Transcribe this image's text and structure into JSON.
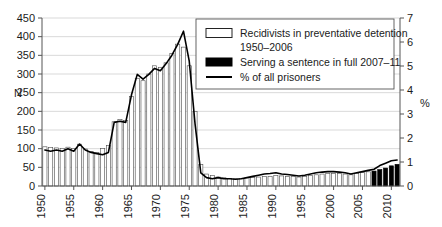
{
  "chart_data": {
    "type": "bar",
    "title": "",
    "subtitle": "",
    "xlabel": "",
    "ylabel": "N",
    "y2label": "%",
    "grid": true,
    "legend_position": "top-right",
    "ylim": [
      0,
      450
    ],
    "y2lim": [
      0,
      7
    ],
    "xlim": [
      1950,
      2011
    ],
    "yticks": [
      0,
      50,
      100,
      150,
      200,
      250,
      300,
      350,
      400,
      450
    ],
    "y2ticks": [
      0,
      1,
      2,
      3,
      4,
      5,
      6,
      7
    ],
    "xticks": [
      1950,
      1955,
      1960,
      1965,
      1970,
      1975,
      1980,
      1985,
      1990,
      1995,
      2000,
      2005,
      2010
    ],
    "categories": [
      1950,
      1951,
      1952,
      1953,
      1954,
      1955,
      1956,
      1957,
      1958,
      1959,
      1960,
      1961,
      1962,
      1963,
      1964,
      1965,
      1966,
      1967,
      1968,
      1969,
      1970,
      1971,
      1972,
      1973,
      1974,
      1975,
      1976,
      1977,
      1978,
      1979,
      1980,
      1981,
      1982,
      1983,
      1984,
      1985,
      1986,
      1987,
      1988,
      1989,
      1990,
      1991,
      1992,
      1993,
      1994,
      1995,
      1996,
      1997,
      1998,
      1999,
      2000,
      2001,
      2002,
      2003,
      2004,
      2005,
      2006,
      2007,
      2008,
      2009,
      2010,
      2011
    ],
    "series": [
      {
        "name": "Recidivists in preventative detention 1950–2006",
        "style": "open-bar",
        "axis": "left",
        "values": [
          105,
          103,
          102,
          101,
          104,
          100,
          112,
          99,
          92,
          90,
          100,
          108,
          172,
          178,
          175,
          240,
          288,
          282,
          300,
          322,
          318,
          330,
          355,
          380,
          372,
          322,
          200,
          58,
          32,
          28,
          24,
          22,
          20,
          19,
          20,
          22,
          23,
          24,
          25,
          26,
          28,
          27,
          26,
          25,
          24,
          26,
          28,
          30,
          32,
          33,
          34,
          33,
          32,
          30,
          33,
          36,
          38,
          null,
          null,
          null,
          null,
          null
        ]
      },
      {
        "name": "Serving a sentence in full 2007–11",
        "style": "solid-bar",
        "axis": "left",
        "values": [
          null,
          null,
          null,
          null,
          null,
          null,
          null,
          null,
          null,
          null,
          null,
          null,
          null,
          null,
          null,
          null,
          null,
          null,
          null,
          null,
          null,
          null,
          null,
          null,
          null,
          null,
          null,
          null,
          null,
          null,
          null,
          null,
          null,
          null,
          null,
          null,
          null,
          null,
          null,
          null,
          null,
          null,
          null,
          null,
          null,
          null,
          null,
          null,
          null,
          null,
          null,
          null,
          null,
          null,
          null,
          null,
          null,
          40,
          44,
          48,
          54,
          58
        ]
      },
      {
        "name": "% of all prisoners",
        "style": "line",
        "axis": "right",
        "values": [
          1.5,
          1.45,
          1.5,
          1.45,
          1.55,
          1.45,
          1.75,
          1.5,
          1.4,
          1.35,
          1.3,
          1.4,
          2.65,
          2.7,
          2.65,
          3.8,
          4.65,
          4.45,
          4.65,
          4.9,
          4.8,
          5.1,
          5.45,
          5.9,
          6.45,
          5.2,
          2.6,
          0.55,
          0.35,
          0.3,
          0.35,
          0.3,
          0.3,
          0.28,
          0.3,
          0.35,
          0.4,
          0.45,
          0.5,
          0.52,
          0.55,
          0.5,
          0.48,
          0.45,
          0.42,
          0.45,
          0.5,
          0.55,
          0.58,
          0.6,
          0.6,
          0.58,
          0.55,
          0.5,
          0.55,
          0.6,
          0.65,
          0.7,
          0.85,
          0.95,
          1.05,
          1.08
        ]
      }
    ]
  },
  "axes": {
    "left_label": "N",
    "right_label": "%",
    "left_ticks": [
      "0",
      "50",
      "100",
      "150",
      "200",
      "250",
      "300",
      "350",
      "400",
      "450"
    ],
    "right_ticks": [
      "0",
      "1",
      "2",
      "3",
      "4",
      "5",
      "6",
      "7"
    ],
    "x_ticks": [
      "1950",
      "1955",
      "1960",
      "1965",
      "1970",
      "1975",
      "1980",
      "1985",
      "1990",
      "1995",
      "2000",
      "2005",
      "2010"
    ]
  },
  "legend": {
    "items": [
      {
        "swatch": "open-bar",
        "line1": "Recidivists in preventative detention",
        "line2": "1950–2006"
      },
      {
        "swatch": "solid-bar",
        "line1": "Serving a sentence in full 2007–11",
        "line2": ""
      },
      {
        "swatch": "line",
        "line1": "% of all prisoners",
        "line2": ""
      }
    ]
  }
}
